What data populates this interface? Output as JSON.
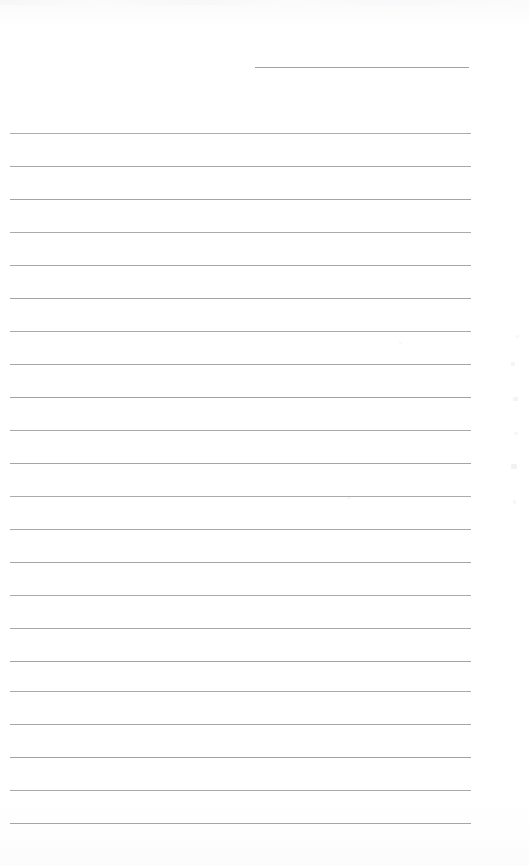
{
  "document": {
    "kind": "scanned-blank-lined-paper",
    "title": "",
    "page_width": 529,
    "page_height": 866,
    "background_color": "#fefefe",
    "rule_color": "#9c9ca0",
    "rule_thickness_px": 1,
    "rule_spacing_px": 33,
    "body_text": "",
    "note": ""
  },
  "header_rule": {
    "label": "header-rule",
    "x": 255,
    "width": 214,
    "y": 67
  },
  "body_rules": {
    "label": "body-rules",
    "x": 10,
    "width": 461,
    "count": 22,
    "first_y": 133,
    "spacing": 33,
    "y_positions": [
      133,
      166,
      199,
      232,
      265,
      298,
      331,
      364,
      397,
      430,
      463,
      496,
      529,
      562,
      595,
      628,
      661,
      691,
      724,
      757,
      790,
      823
    ]
  },
  "margins": {
    "left_px": 10,
    "right_px": 58,
    "top_px": 67,
    "bottom_px": 43
  },
  "artifacts": {
    "label": "scan-artifacts",
    "marks": [
      {
        "x": 511,
        "y": 362,
        "w": 4,
        "h": 4,
        "o": 0.3
      },
      {
        "x": 513,
        "y": 397,
        "w": 5,
        "h": 4,
        "o": 0.32
      },
      {
        "x": 514,
        "y": 432,
        "w": 4,
        "h": 3,
        "o": 0.22
      },
      {
        "x": 511,
        "y": 464,
        "w": 6,
        "h": 5,
        "o": 0.34
      },
      {
        "x": 513,
        "y": 500,
        "w": 3,
        "h": 4,
        "o": 0.2
      },
      {
        "x": 516,
        "y": 335,
        "w": 3,
        "h": 3,
        "o": 0.18
      },
      {
        "x": 399,
        "y": 342,
        "w": 3,
        "h": 2,
        "o": 0.22
      },
      {
        "x": 347,
        "y": 497,
        "w": 4,
        "h": 2,
        "o": 0.2
      },
      {
        "x": 8,
        "y": 596,
        "w": 3,
        "h": 2,
        "o": 0.18
      }
    ]
  }
}
